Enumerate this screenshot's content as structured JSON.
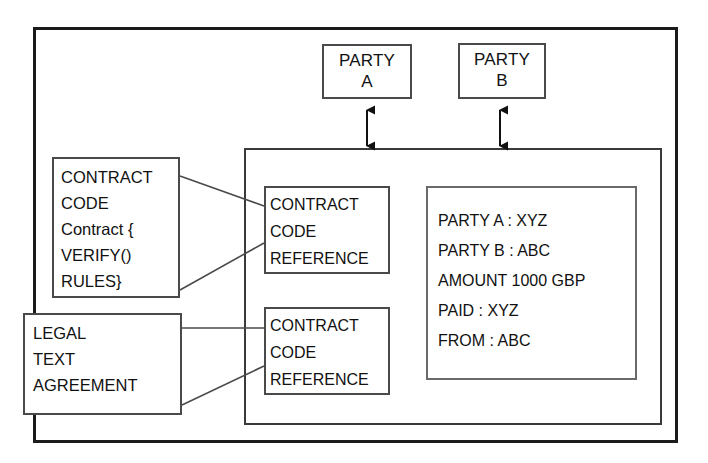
{
  "diagram": {
    "frame": {
      "name": "outer-frame"
    },
    "parties": [
      {
        "id": "party-a",
        "lines": [
          "PARTY",
          "A"
        ]
      },
      {
        "id": "party-b",
        "lines": [
          "PARTY",
          "B"
        ]
      }
    ],
    "source_boxes": [
      {
        "id": "contract-code",
        "lines": [
          "CONTRACT",
          "CODE",
          "Contract {",
          "VERIFY()",
          "RULES}"
        ]
      },
      {
        "id": "legal-text",
        "lines": [
          "LEGAL",
          "TEXT",
          "AGREEMENT"
        ]
      }
    ],
    "reference_boxes": [
      {
        "id": "ref-1",
        "lines": [
          "CONTRACT",
          "CODE",
          "REFERENCE"
        ]
      },
      {
        "id": "ref-2",
        "lines": [
          "CONTRACT",
          "CODE",
          "REFERENCE"
        ]
      }
    ],
    "data_panel": {
      "id": "contract-state",
      "lines": [
        "PARTY A : XYZ",
        "PARTY B : ABC",
        "AMOUNT  1000 GBP",
        "PAID : XYZ",
        "FROM : ABC"
      ]
    },
    "connectors": [
      {
        "id": "party-a-link",
        "kind": "double-arrow",
        "from": "party-a",
        "to": "contract-container"
      },
      {
        "id": "party-b-link",
        "kind": "double-arrow",
        "from": "party-b",
        "to": "contract-container"
      },
      {
        "id": "code-link-top",
        "kind": "line",
        "from": "contract-code",
        "to": "ref-1"
      },
      {
        "id": "code-link-bottom",
        "kind": "line",
        "from": "contract-code",
        "to": "ref-1"
      },
      {
        "id": "legal-link-top",
        "kind": "line",
        "from": "legal-text",
        "to": "ref-2"
      },
      {
        "id": "legal-link-bottom",
        "kind": "line",
        "from": "legal-text",
        "to": "ref-2"
      }
    ],
    "colors": {
      "background": "#ffffff",
      "frame_stroke": "#1b1b1b",
      "box_stroke": "#4a4a4a",
      "text": "#111111"
    }
  }
}
